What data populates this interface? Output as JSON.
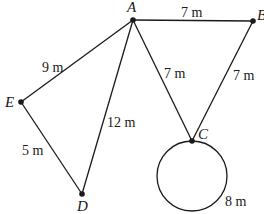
{
  "diagram": {
    "type": "geometry-figure",
    "points": [
      {
        "id": "A",
        "label": "A",
        "x": 133,
        "y": 20,
        "label_x": 127,
        "label_y": 12
      },
      {
        "id": "B",
        "label": "B",
        "x": 253,
        "y": 21,
        "label_x": 257,
        "label_y": 20
      },
      {
        "id": "C",
        "label": "C",
        "x": 192,
        "y": 141,
        "label_x": 198,
        "label_y": 139
      },
      {
        "id": "D",
        "label": "D",
        "x": 82,
        "y": 194,
        "label_x": 77,
        "label_y": 211
      },
      {
        "id": "E",
        "label": "E",
        "x": 21,
        "y": 102,
        "label_x": 5,
        "label_y": 107
      }
    ],
    "edges": [
      {
        "from": "A",
        "to": "B",
        "length_label": "7 m",
        "label_x": 181,
        "label_y": 17
      },
      {
        "from": "A",
        "to": "E",
        "length_label": "9 m",
        "label_x": 42,
        "label_y": 72
      },
      {
        "from": "A",
        "to": "D",
        "length_label": "12 m",
        "label_x": 107,
        "label_y": 127
      },
      {
        "from": "A",
        "to": "C",
        "length_label": "7 m",
        "label_x": 164,
        "label_y": 78
      },
      {
        "from": "B",
        "to": "C",
        "length_label": "7 m",
        "label_x": 233,
        "label_y": 80
      },
      {
        "from": "E",
        "to": "D",
        "length_label": "5 m",
        "label_x": 22,
        "label_y": 155
      }
    ],
    "circle": {
      "through": "C",
      "cx": 192,
      "cy": 176,
      "r": 35,
      "circumference_label": "8 m",
      "label_x": 225,
      "label_y": 206
    },
    "colors": {
      "stroke": "#1a1a1a",
      "background": "#ffffff"
    }
  }
}
